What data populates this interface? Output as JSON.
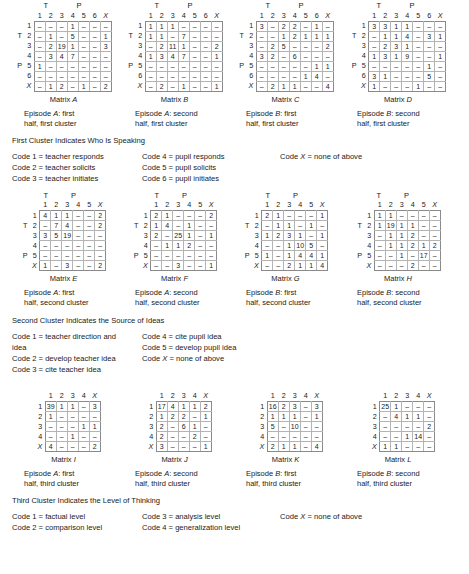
{
  "figure": {
    "group_labels": {
      "teacher": "T",
      "pupil": "P"
    },
    "dash": "–"
  },
  "rows": [
    {
      "id": "cluster-1",
      "matrices": [
        {
          "name": "A",
          "title": "Matrix A",
          "caption_line1": "Episode A: first",
          "caption_line2": "half, first cluster",
          "col_headers": [
            "1",
            "2",
            "3",
            "4",
            "5",
            "6",
            "X"
          ],
          "row_headers": [
            "1",
            "2",
            "3",
            "4",
            "5",
            "6",
            "X"
          ],
          "group_split_col": 3,
          "group_split_row": 3,
          "cells": [
            [
              "–",
              "–",
              "–",
              "1",
              "–",
              "–",
              "–"
            ],
            [
              "–",
              "1",
              "–",
              "5",
              "–",
              "–",
              "1"
            ],
            [
              "–",
              "2",
              "19",
              "1",
              "–",
              "–",
              "3"
            ],
            [
              "–",
              "3",
              "4",
              "7",
              "–",
              "–",
              "–"
            ],
            [
              "1",
              "–",
              "–",
              "–",
              "–",
              "–",
              "–"
            ],
            [
              "–",
              "–",
              "–",
              "–",
              "–",
              "–",
              "–"
            ],
            [
              "–",
              "1",
              "2",
              "–",
              "1",
              "–",
              "2"
            ]
          ]
        },
        {
          "name": "B",
          "title": "Matrix B",
          "caption_line1": "Episode A: second",
          "caption_line2": "half, first cluster",
          "col_headers": [
            "1",
            "2",
            "3",
            "4",
            "5",
            "6",
            "X"
          ],
          "row_headers": [
            "1",
            "2",
            "3",
            "4",
            "5",
            "6",
            "X"
          ],
          "group_split_col": 3,
          "group_split_row": 3,
          "cells": [
            [
              "1",
              "1",
              "1",
              "–",
              "–",
              "–",
              "–"
            ],
            [
              "1",
              "1",
              "–",
              "7",
              "–",
              "–",
              "–"
            ],
            [
              "–",
              "2",
              "11",
              "1",
              "–",
              "–",
              "2"
            ],
            [
              "1",
              "3",
              "4",
              "7",
              "–",
              "–",
              "1"
            ],
            [
              "–",
              "–",
              "–",
              "–",
              "–",
              "–",
              "–"
            ],
            [
              "–",
              "–",
              "–",
              "–",
              "–",
              "–",
              "–"
            ],
            [
              "–",
              "2",
              "–",
              "1",
              "–",
              "–",
              "1"
            ]
          ]
        },
        {
          "name": "C",
          "title": "Matrix C",
          "caption_line1": "Episode B: first",
          "caption_line2": "half, first cluster",
          "col_headers": [
            "1",
            "2",
            "3",
            "4",
            "5",
            "6",
            "X"
          ],
          "row_headers": [
            "1",
            "2",
            "3",
            "4",
            "5",
            "6",
            "X"
          ],
          "group_split_col": 3,
          "group_split_row": 3,
          "cells": [
            [
              "3",
              "–",
              "2",
              "2",
              "–",
              "1",
              "–"
            ],
            [
              "–",
              "–",
              "1",
              "2",
              "1",
              "1",
              "1"
            ],
            [
              "–",
              "2",
              "5",
              "–",
              "–",
              "–",
              "2"
            ],
            [
              "3",
              "2",
              "–",
              "6",
              "–",
              "–",
              "–"
            ],
            [
              "–",
              "–",
              "–",
              "–",
              "–",
              "1",
              "1"
            ],
            [
              "–",
              "–",
              "–",
              "–",
              "1",
              "4",
              "–"
            ],
            [
              "–",
              "2",
              "1",
              "1",
              "–",
              "–",
              "4"
            ]
          ]
        },
        {
          "name": "D",
          "title": "Matrix D",
          "caption_line1": "Episode B: second",
          "caption_line2": "half, first cluster",
          "col_headers": [
            "1",
            "2",
            "3",
            "4",
            "5",
            "6",
            "X"
          ],
          "row_headers": [
            "1",
            "2",
            "3",
            "4",
            "5",
            "6",
            "X"
          ],
          "group_split_col": 3,
          "group_split_row": 3,
          "cells": [
            [
              "3",
              "3",
              "1",
              "1",
              "–",
              "–",
              "–"
            ],
            [
              "–",
              "1",
              "1",
              "4",
              "–",
              "3",
              "1"
            ],
            [
              "–",
              "2",
              "3",
              "1",
              "–",
              "–",
              "–"
            ],
            [
              "1",
              "3",
              "1",
              "9",
              "–",
              "–",
              "1"
            ],
            [
              "–",
              "–",
              "–",
              "–",
              "–",
              "1",
              "–"
            ],
            [
              "3",
              "1",
              "–",
              "–",
              "–",
              "5",
              "–"
            ],
            [
              "1",
              "–",
              "–",
              "–",
              "1",
              "–",
              "–"
            ]
          ]
        }
      ],
      "legend": {
        "title": "First Cluster Indicates Who Is Speaking",
        "columns": [
          [
            "Code 1 = teacher responds",
            "Code 2 = teacher solicits",
            "Code 3 = teacher initiates"
          ],
          [
            "Code 4 = pupil responds",
            "Code 5 = pupil solicits",
            "Code 6 = pupil initiates"
          ],
          [
            "Code X = none of above"
          ]
        ]
      }
    },
    {
      "id": "cluster-2",
      "matrices": [
        {
          "name": "E",
          "title": "Matrix E",
          "caption_line1": "Episode A: first",
          "caption_line2": "half, second cluster",
          "col_headers": [
            "1",
            "2",
            "3",
            "4",
            "5",
            "X"
          ],
          "row_headers": [
            "1",
            "2",
            "3",
            "4",
            "5",
            "X"
          ],
          "group_split_col": 3,
          "group_split_row": 3,
          "cells": [
            [
              "4",
              "1",
              "1",
              "–",
              "–",
              "2"
            ],
            [
              "–",
              "7",
              "4",
              "–",
              "–",
              "2"
            ],
            [
              "3",
              "5",
              "19",
              "–",
              "–",
              "–"
            ],
            [
              "–",
              "–",
              "–",
              "–",
              "–",
              "–"
            ],
            [
              "–",
              "–",
              "–",
              "–",
              "–",
              "–"
            ],
            [
              "1",
              "–",
              "3",
              "–",
              "–",
              "2"
            ]
          ]
        },
        {
          "name": "F",
          "title": "Matrix F",
          "caption_line1": "Episode A: second",
          "caption_line2": "half, second cluster",
          "col_headers": [
            "1",
            "2",
            "3",
            "4",
            "5",
            "X"
          ],
          "row_headers": [
            "1",
            "2",
            "3",
            "4",
            "5",
            "X"
          ],
          "group_split_col": 3,
          "group_split_row": 3,
          "cells": [
            [
              "2",
              "1",
              "–",
              "–",
              "–",
              "2"
            ],
            [
              "1",
              "4",
              "–",
              "1",
              "–",
              "–"
            ],
            [
              "2",
              "–",
              "25",
              "1",
              "–",
              "1"
            ],
            [
              "–",
              "1",
              "1",
              "2",
              "–",
              "–"
            ],
            [
              "–",
              "–",
              "–",
              "–",
              "–",
              "–"
            ],
            [
              "–",
              "–",
              "3",
              "–",
              "–",
              "1"
            ]
          ]
        },
        {
          "name": "G",
          "title": "Matrix G",
          "caption_line1": "Episode B: first",
          "caption_line2": "half, second cluster",
          "col_headers": [
            "1",
            "2",
            "3",
            "4",
            "5",
            "X"
          ],
          "row_headers": [
            "1",
            "2",
            "3",
            "4",
            "5",
            "X"
          ],
          "group_split_col": 3,
          "group_split_row": 3,
          "cells": [
            [
              "2",
              "1",
              "–",
              "–",
              "–",
              "1"
            ],
            [
              "–",
              "1",
              "1",
              "–",
              "1",
              "–"
            ],
            [
              "1",
              "2",
              "3",
              "1",
              "–",
              "1"
            ],
            [
              "–",
              "–",
              "1",
              "10",
              "5",
              "–"
            ],
            [
              "1",
              "–",
              "1",
              "4",
              "4",
              "1"
            ],
            [
              "–",
              "–",
              "2",
              "1",
              "1",
              "4"
            ]
          ]
        },
        {
          "name": "H",
          "title": "Matrix H",
          "caption_line1": "Episode B: second",
          "caption_line2": "half, second cluster",
          "col_headers": [
            "1",
            "2",
            "3",
            "4",
            "5",
            "X"
          ],
          "row_headers": [
            "1",
            "2",
            "3",
            "4",
            "5",
            "X"
          ],
          "group_split_col": 3,
          "group_split_row": 3,
          "cells": [
            [
              "1",
              "1",
              "–",
              "–",
              "–",
              "–"
            ],
            [
              "1",
              "19",
              "1",
              "1",
              "–",
              "–"
            ],
            [
              "–",
              "1",
              "1",
              "2",
              "–",
              "–"
            ],
            [
              "–",
              "1",
              "1",
              "2",
              "1",
              "2"
            ],
            [
              "–",
              "–",
              "1",
              "–",
              "17",
              "–"
            ],
            [
              "–",
              "–",
              "–",
              "2",
              "–",
              "–"
            ]
          ]
        }
      ],
      "legend": {
        "title": "Second Cluster Indicates the Source of Ideas",
        "columns": [
          [
            "Code 1 = teacher direction and idea",
            "Code 2 = develop teacher idea",
            "Code 3 = cite teacher idea"
          ],
          [
            "Code 4 = cite pupil idea",
            "Code 5 = develop pupil idea",
            "Code X = none of above"
          ],
          []
        ]
      }
    },
    {
      "id": "cluster-3",
      "matrices": [
        {
          "name": "I",
          "title": "Matrix I",
          "caption_line1": "Episode A: first",
          "caption_line2": "half, third cluster",
          "col_headers": [
            "1",
            "2",
            "3",
            "4",
            "X"
          ],
          "row_headers": [
            "1",
            "2",
            "3",
            "4",
            "X"
          ],
          "group_split_col": -1,
          "group_split_row": 4,
          "cells": [
            [
              "39",
              "1",
              "1",
              "–",
              "3"
            ],
            [
              "1",
              "–",
              "–",
              "–",
              "–"
            ],
            [
              "–",
              "–",
              "–",
              "1",
              "1"
            ],
            [
              "–",
              "–",
              "1",
              "–",
              "–"
            ],
            [
              "4",
              "–",
              "–",
              "–",
              "2"
            ]
          ]
        },
        {
          "name": "J",
          "title": "Matrix J",
          "caption_line1": "Episode A: second",
          "caption_line2": "half, third cluster",
          "col_headers": [
            "1",
            "2",
            "3",
            "4",
            "X"
          ],
          "row_headers": [
            "1",
            "2",
            "3",
            "4",
            "X"
          ],
          "group_split_col": -1,
          "group_split_row": 4,
          "cells": [
            [
              "17",
              "4",
              "1",
              "1",
              "2"
            ],
            [
              "1",
              "2",
              "2",
              "–",
              "1"
            ],
            [
              "2",
              "–",
              "6",
              "1",
              "–"
            ],
            [
              "2",
              "–",
              "–",
              "2",
              "–"
            ],
            [
              "3",
              "–",
              "–",
              "–",
              "1"
            ]
          ]
        },
        {
          "name": "K",
          "title": "Matrix K",
          "caption_line1": "Episode B: first",
          "caption_line2": "half, third cluster",
          "col_headers": [
            "1",
            "2",
            "3",
            "4",
            "X"
          ],
          "row_headers": [
            "1",
            "2",
            "3",
            "4",
            "X"
          ],
          "group_split_col": -1,
          "group_split_row": 4,
          "cells": [
            [
              "16",
              "2",
              "3",
              "–",
              "3"
            ],
            [
              "1",
              "1",
              "1",
              "–",
              "1"
            ],
            [
              "5",
              "–",
              "10",
              "–",
              "–"
            ],
            [
              "–",
              "–",
              "–",
              "–",
              "–"
            ],
            [
              "2",
              "1",
              "1",
              "–",
              "4"
            ]
          ]
        },
        {
          "name": "L",
          "title": "Matrix L",
          "caption_line1": "Episode B: second",
          "caption_line2": "half, third cluster",
          "col_headers": [
            "1",
            "2",
            "3",
            "4",
            "X"
          ],
          "row_headers": [
            "1",
            "2",
            "3",
            "4",
            "X"
          ],
          "group_split_col": -1,
          "group_split_row": 4,
          "cells": [
            [
              "25",
              "1",
              "–",
              "–",
              "–"
            ],
            [
              "–",
              "4",
              "1",
              "1",
              "–"
            ],
            [
              "–",
              "–",
              "–",
              "–",
              "2"
            ],
            [
              "–",
              "–",
              "1",
              "14",
              "–"
            ],
            [
              "1",
              "1",
              "–",
              "–",
              "–"
            ]
          ]
        }
      ],
      "legend": {
        "title": "Third Cluster Indicates the Level of Thinking",
        "columns": [
          [
            "Code 1 = factual level",
            "Code 2 = comparison level"
          ],
          [
            "Code 3 = analysis level",
            "Code 4 = generalization level"
          ],
          [
            "Code X = none of above"
          ]
        ]
      }
    }
  ]
}
